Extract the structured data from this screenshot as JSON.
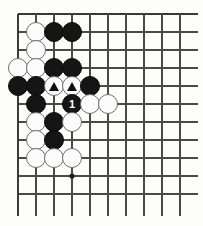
{
  "diagram": {
    "type": "go-board-diagram",
    "board": {
      "visible_columns": 10,
      "visible_rows": 11,
      "origin_x": 18,
      "origin_y": 14,
      "spacing": 18,
      "edge_top": true,
      "edge_left": true,
      "edge_right_cut": true,
      "edge_bottom_cut": true,
      "line_color": "#4a4a4a",
      "edge_line_color": "#3a3a3a",
      "background_color": "#fdfdfc"
    },
    "star_points": [
      {
        "col": 4,
        "row": 10
      }
    ],
    "stones": [
      {
        "col": 2,
        "row": 2,
        "color": "white",
        "label": "",
        "mark": ""
      },
      {
        "col": 3,
        "row": 2,
        "color": "black",
        "label": "",
        "mark": ""
      },
      {
        "col": 4,
        "row": 2,
        "color": "black",
        "label": "",
        "mark": ""
      },
      {
        "col": 2,
        "row": 3,
        "color": "white",
        "label": "",
        "mark": ""
      },
      {
        "col": 1,
        "row": 4,
        "color": "white",
        "label": "",
        "mark": ""
      },
      {
        "col": 2,
        "row": 4,
        "color": "white",
        "label": "",
        "mark": ""
      },
      {
        "col": 3,
        "row": 4,
        "color": "black",
        "label": "",
        "mark": ""
      },
      {
        "col": 4,
        "row": 4,
        "color": "black",
        "label": "",
        "mark": ""
      },
      {
        "col": 1,
        "row": 5,
        "color": "black",
        "label": "",
        "mark": ""
      },
      {
        "col": 2,
        "row": 5,
        "color": "black",
        "label": "",
        "mark": ""
      },
      {
        "col": 3,
        "row": 5,
        "color": "white",
        "label": "",
        "mark": "triangle"
      },
      {
        "col": 4,
        "row": 5,
        "color": "white",
        "label": "",
        "mark": "triangle"
      },
      {
        "col": 5,
        "row": 5,
        "color": "black",
        "label": "",
        "mark": ""
      },
      {
        "col": 2,
        "row": 6,
        "color": "black",
        "label": "",
        "mark": ""
      },
      {
        "col": 4,
        "row": 6,
        "color": "black",
        "label": "1",
        "mark": ""
      },
      {
        "col": 5,
        "row": 6,
        "color": "white",
        "label": "",
        "mark": ""
      },
      {
        "col": 6,
        "row": 6,
        "color": "white",
        "label": "",
        "mark": ""
      },
      {
        "col": 2,
        "row": 7,
        "color": "white",
        "label": "",
        "mark": ""
      },
      {
        "col": 3,
        "row": 7,
        "color": "black",
        "label": "",
        "mark": ""
      },
      {
        "col": 4,
        "row": 7,
        "color": "white",
        "label": "",
        "mark": ""
      },
      {
        "col": 2,
        "row": 8,
        "color": "white",
        "label": "",
        "mark": ""
      },
      {
        "col": 3,
        "row": 8,
        "color": "black",
        "label": "",
        "mark": ""
      },
      {
        "col": 2,
        "row": 9,
        "color": "white",
        "label": "",
        "mark": ""
      },
      {
        "col": 3,
        "row": 9,
        "color": "white",
        "label": "",
        "mark": ""
      },
      {
        "col": 4,
        "row": 9,
        "color": "white",
        "label": "",
        "mark": ""
      }
    ]
  }
}
